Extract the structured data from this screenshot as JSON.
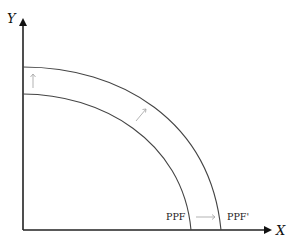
{
  "diagram": {
    "type": "production-possibility-frontier-shift",
    "axes": {
      "y_label": "Y",
      "x_label": "X"
    },
    "curves": [
      {
        "name": "inner",
        "label": "PPF"
      },
      {
        "name": "outer",
        "label": "PPF'"
      }
    ],
    "shift_arrows": [
      "up",
      "diagonal-outward",
      "right"
    ],
    "colors": {
      "axis": "#111111",
      "curve": "#444444",
      "arrow": "#aaaaaa",
      "background": "#ffffff"
    }
  }
}
